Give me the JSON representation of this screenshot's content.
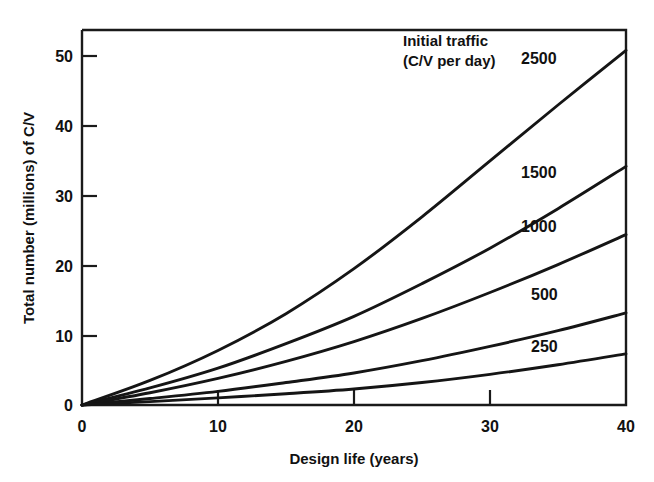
{
  "chart_data": {
    "type": "line",
    "title": "",
    "xlabel": "Design life (years)",
    "ylabel": "Total number (millions) of C/V",
    "xlim": [
      0,
      40
    ],
    "ylim": [
      0,
      55
    ],
    "xticks": [
      "0",
      "10",
      "20",
      "30",
      "40"
    ],
    "xtick_values": [
      0,
      10,
      20,
      30,
      40
    ],
    "yticks": [
      "0",
      "10",
      "20",
      "30",
      "40",
      "50"
    ],
    "ytick_values": [
      0,
      10,
      20,
      30,
      40,
      50
    ],
    "grid": false,
    "legend_position": "in-plot-top-right",
    "legend_title_line1": "Initial traffic",
    "legend_title_line2": "(C/V per day)",
    "x": [
      0,
      5,
      10,
      15,
      20,
      25,
      30,
      35,
      40
    ],
    "series": [
      {
        "name": "2500",
        "label": "2500",
        "values": [
          0,
          3.6,
          8.0,
          13.4,
          20.0,
          27.6,
          35.8,
          44.0,
          52.0
        ]
      },
      {
        "name": "1500",
        "label": "1500",
        "values": [
          0,
          2.5,
          5.4,
          9.0,
          13.0,
          17.8,
          23.0,
          28.8,
          35.0
        ]
      },
      {
        "name": "1000",
        "label": "1000",
        "values": [
          0,
          1.8,
          3.9,
          6.4,
          9.3,
          12.7,
          16.5,
          20.6,
          25.0
        ]
      },
      {
        "name": "500",
        "label": "500",
        "values": [
          0,
          0.95,
          2.0,
          3.3,
          4.7,
          6.5,
          8.6,
          10.9,
          13.5
        ]
      },
      {
        "name": "250",
        "label": "250",
        "values": [
          0,
          0.5,
          1.05,
          1.65,
          2.35,
          3.3,
          4.5,
          5.9,
          7.5
        ]
      }
    ]
  }
}
